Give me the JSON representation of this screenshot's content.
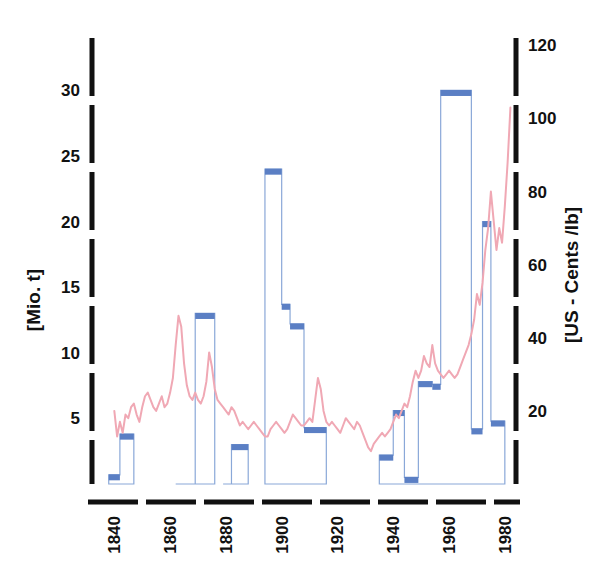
{
  "chart_data": {
    "type": "bar",
    "title": "",
    "subtitle": "",
    "xlabel": "",
    "ylabel": "[Mio. t]",
    "y2label": "[US - Cents /lb]",
    "grid": false,
    "legend": "none",
    "xlim": [
      1832,
      1984
    ],
    "ylim": [
      0,
      34
    ],
    "y2lim": [
      0,
      122
    ],
    "xticks": [
      "1840",
      "1860",
      "1880",
      "1900",
      "1920",
      "1940",
      "1960",
      "1980"
    ],
    "xtick_values": [
      1840,
      1860,
      1880,
      1900,
      1920,
      1940,
      1960,
      1980
    ],
    "yticks": [
      "5",
      "10",
      "15",
      "20",
      "25",
      "30"
    ],
    "ytick_values": [
      5,
      10,
      15,
      20,
      25,
      30
    ],
    "y2ticks": [
      "20",
      "40",
      "60",
      "80",
      "100",
      "120"
    ],
    "y2tick_values": [
      20,
      40,
      60,
      80,
      100,
      120
    ],
    "colors": {
      "bar_fill": "#ffffff",
      "bar_stroke": "#8aa8d8",
      "bar_cap": "#5b7fc4",
      "line": "#f0a8b4",
      "axis": "#111111"
    },
    "series": [
      {
        "name": "Production",
        "axis": "left",
        "unit": "Mio. t",
        "type": "step-bar",
        "steps": [
          {
            "from": 1838,
            "to": 1842,
            "value": 0.7
          },
          {
            "from": 1842,
            "to": 1847,
            "value": 3.8
          },
          {
            "from": 1862,
            "to": 1869,
            "value": 0.0
          },
          {
            "from": 1869,
            "to": 1876,
            "value": 13.0
          },
          {
            "from": 1879,
            "to": 1882,
            "value": 0.0
          },
          {
            "from": 1882,
            "to": 1888,
            "value": 3.0
          },
          {
            "from": 1894,
            "to": 1900,
            "value": 24.0
          },
          {
            "from": 1900,
            "to": 1903,
            "value": 13.7
          },
          {
            "from": 1903,
            "to": 1908,
            "value": 12.2
          },
          {
            "from": 1908,
            "to": 1916,
            "value": 4.3
          },
          {
            "from": 1935,
            "to": 1940,
            "value": 2.2
          },
          {
            "from": 1940,
            "to": 1944,
            "value": 5.6
          },
          {
            "from": 1944,
            "to": 1949,
            "value": 0.5
          },
          {
            "from": 1949,
            "to": 1954,
            "value": 7.8
          },
          {
            "from": 1954,
            "to": 1957,
            "value": 7.6
          },
          {
            "from": 1957,
            "to": 1968,
            "value": 30.0
          },
          {
            "from": 1968,
            "to": 1972,
            "value": 4.2
          },
          {
            "from": 1972,
            "to": 1975,
            "value": 20.0
          },
          {
            "from": 1975,
            "to": 1980,
            "value": 4.8
          }
        ]
      },
      {
        "name": "Price",
        "axis": "right",
        "unit": "US - Cents /lb",
        "type": "line",
        "points": [
          [
            1840,
            20
          ],
          [
            1841,
            13
          ],
          [
            1842,
            17
          ],
          [
            1843,
            14
          ],
          [
            1844,
            19
          ],
          [
            1845,
            18
          ],
          [
            1846,
            21
          ],
          [
            1847,
            22
          ],
          [
            1848,
            19
          ],
          [
            1849,
            17
          ],
          [
            1850,
            21
          ],
          [
            1851,
            24
          ],
          [
            1852,
            25
          ],
          [
            1853,
            23
          ],
          [
            1854,
            21
          ],
          [
            1855,
            20
          ],
          [
            1856,
            22
          ],
          [
            1857,
            24
          ],
          [
            1858,
            21
          ],
          [
            1859,
            22
          ],
          [
            1860,
            25
          ],
          [
            1861,
            29
          ],
          [
            1862,
            38
          ],
          [
            1863,
            46
          ],
          [
            1864,
            43
          ],
          [
            1865,
            33
          ],
          [
            1866,
            27
          ],
          [
            1867,
            24
          ],
          [
            1868,
            23
          ],
          [
            1869,
            25
          ],
          [
            1870,
            23
          ],
          [
            1871,
            22
          ],
          [
            1872,
            24
          ],
          [
            1873,
            28
          ],
          [
            1874,
            36
          ],
          [
            1875,
            32
          ],
          [
            1876,
            26
          ],
          [
            1877,
            23
          ],
          [
            1878,
            22
          ],
          [
            1879,
            21
          ],
          [
            1880,
            20
          ],
          [
            1881,
            19
          ],
          [
            1882,
            21
          ],
          [
            1883,
            20
          ],
          [
            1884,
            18
          ],
          [
            1885,
            16
          ],
          [
            1886,
            17
          ],
          [
            1887,
            16
          ],
          [
            1888,
            15
          ],
          [
            1889,
            16
          ],
          [
            1890,
            17
          ],
          [
            1891,
            16
          ],
          [
            1892,
            15
          ],
          [
            1893,
            14
          ],
          [
            1894,
            13
          ],
          [
            1895,
            13
          ],
          [
            1896,
            15
          ],
          [
            1897,
            16
          ],
          [
            1898,
            17
          ],
          [
            1899,
            16
          ],
          [
            1900,
            15
          ],
          [
            1901,
            14
          ],
          [
            1902,
            15
          ],
          [
            1903,
            17
          ],
          [
            1904,
            19
          ],
          [
            1905,
            18
          ],
          [
            1906,
            17
          ],
          [
            1907,
            16
          ],
          [
            1908,
            16
          ],
          [
            1909,
            17
          ],
          [
            1910,
            18
          ],
          [
            1911,
            17
          ],
          [
            1912,
            23
          ],
          [
            1913,
            29
          ],
          [
            1914,
            26
          ],
          [
            1915,
            20
          ],
          [
            1916,
            17
          ],
          [
            1917,
            16
          ],
          [
            1918,
            17
          ],
          [
            1919,
            16
          ],
          [
            1920,
            15
          ],
          [
            1921,
            14
          ],
          [
            1922,
            16
          ],
          [
            1923,
            18
          ],
          [
            1924,
            17
          ],
          [
            1925,
            16
          ],
          [
            1926,
            15
          ],
          [
            1927,
            17
          ],
          [
            1928,
            16
          ],
          [
            1929,
            14
          ],
          [
            1930,
            12
          ],
          [
            1931,
            10
          ],
          [
            1932,
            9
          ],
          [
            1933,
            11
          ],
          [
            1934,
            12
          ],
          [
            1935,
            13
          ],
          [
            1936,
            14
          ],
          [
            1937,
            13
          ],
          [
            1938,
            14
          ],
          [
            1939,
            15
          ],
          [
            1940,
            17
          ],
          [
            1941,
            19
          ],
          [
            1942,
            18
          ],
          [
            1943,
            20
          ],
          [
            1944,
            22
          ],
          [
            1945,
            21
          ],
          [
            1946,
            24
          ],
          [
            1947,
            28
          ],
          [
            1948,
            31
          ],
          [
            1949,
            29
          ],
          [
            1950,
            31
          ],
          [
            1951,
            35
          ],
          [
            1952,
            33
          ],
          [
            1953,
            32
          ],
          [
            1954,
            38
          ],
          [
            1955,
            33
          ],
          [
            1956,
            31
          ],
          [
            1957,
            30
          ],
          [
            1958,
            29
          ],
          [
            1959,
            30
          ],
          [
            1960,
            31
          ],
          [
            1961,
            30
          ],
          [
            1962,
            29
          ],
          [
            1963,
            30
          ],
          [
            1964,
            32
          ],
          [
            1965,
            34
          ],
          [
            1966,
            36
          ],
          [
            1967,
            38
          ],
          [
            1968,
            41
          ],
          [
            1969,
            45
          ],
          [
            1970,
            52
          ],
          [
            1971,
            49
          ],
          [
            1972,
            55
          ],
          [
            1973,
            64
          ],
          [
            1974,
            70
          ],
          [
            1975,
            80
          ],
          [
            1976,
            72
          ],
          [
            1977,
            64
          ],
          [
            1978,
            70
          ],
          [
            1979,
            66
          ],
          [
            1980,
            76
          ],
          [
            1981,
            88
          ],
          [
            1982,
            103
          ]
        ]
      }
    ]
  }
}
